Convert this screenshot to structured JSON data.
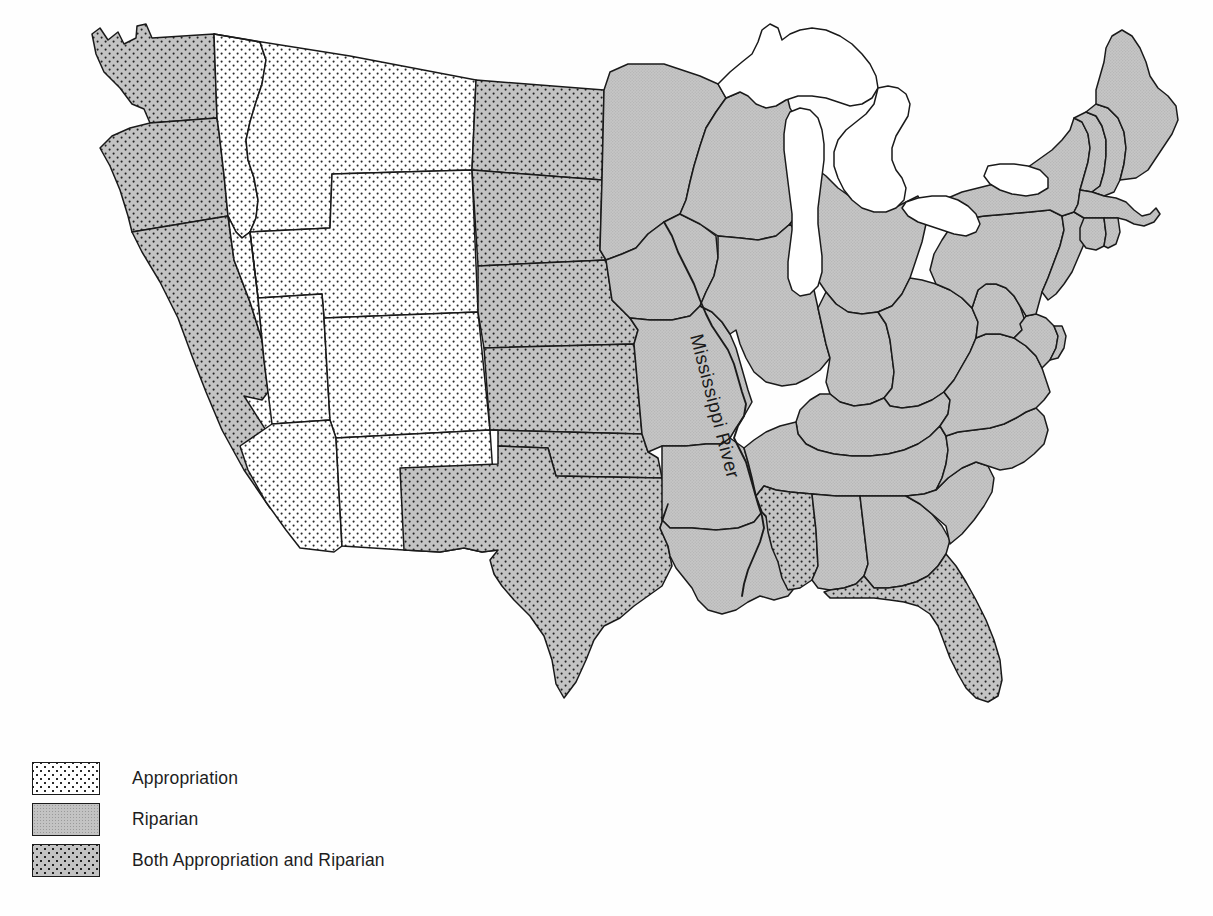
{
  "figure": {
    "background_color": "#fefefe"
  },
  "map": {
    "river_label": "Mississippi River",
    "colors": {
      "riparian_gray": "#c3c3c3",
      "appropriation_white": "#ffffff",
      "both_gray": "#c3c3c3",
      "dot_color": "#232323",
      "outline": "#1a1a1a",
      "lake_fill": "#ffffff"
    },
    "categories": {
      "appropriation": "Appropriation",
      "riparian": "Riparian",
      "both": "Both Appropriation and Riparian"
    },
    "states": [
      {
        "name": "Washington",
        "code": "WA",
        "doctrine": "both"
      },
      {
        "name": "Oregon",
        "code": "OR",
        "doctrine": "both"
      },
      {
        "name": "California",
        "code": "CA",
        "doctrine": "both"
      },
      {
        "name": "Idaho",
        "code": "ID",
        "doctrine": "appropriation"
      },
      {
        "name": "Nevada",
        "code": "NV",
        "doctrine": "appropriation"
      },
      {
        "name": "Montana",
        "code": "MT",
        "doctrine": "appropriation"
      },
      {
        "name": "Wyoming",
        "code": "WY",
        "doctrine": "appropriation"
      },
      {
        "name": "Utah",
        "code": "UT",
        "doctrine": "appropriation"
      },
      {
        "name": "Arizona",
        "code": "AZ",
        "doctrine": "appropriation"
      },
      {
        "name": "Colorado",
        "code": "CO",
        "doctrine": "appropriation"
      },
      {
        "name": "New Mexico",
        "code": "NM",
        "doctrine": "appropriation"
      },
      {
        "name": "North Dakota",
        "code": "ND",
        "doctrine": "both"
      },
      {
        "name": "South Dakota",
        "code": "SD",
        "doctrine": "both"
      },
      {
        "name": "Nebraska",
        "code": "NE",
        "doctrine": "both"
      },
      {
        "name": "Kansas",
        "code": "KS",
        "doctrine": "both"
      },
      {
        "name": "Oklahoma",
        "code": "OK",
        "doctrine": "both"
      },
      {
        "name": "Texas",
        "code": "TX",
        "doctrine": "both"
      },
      {
        "name": "Minnesota",
        "code": "MN",
        "doctrine": "riparian"
      },
      {
        "name": "Iowa",
        "code": "IA",
        "doctrine": "riparian"
      },
      {
        "name": "Missouri",
        "code": "MO",
        "doctrine": "riparian"
      },
      {
        "name": "Arkansas",
        "code": "AR",
        "doctrine": "riparian"
      },
      {
        "name": "Louisiana",
        "code": "LA",
        "doctrine": "riparian"
      },
      {
        "name": "Wisconsin",
        "code": "WI",
        "doctrine": "riparian"
      },
      {
        "name": "Illinois",
        "code": "IL",
        "doctrine": "riparian"
      },
      {
        "name": "Michigan",
        "code": "MI",
        "doctrine": "riparian"
      },
      {
        "name": "Indiana",
        "code": "IN",
        "doctrine": "riparian"
      },
      {
        "name": "Ohio",
        "code": "OH",
        "doctrine": "riparian"
      },
      {
        "name": "Kentucky",
        "code": "KY",
        "doctrine": "riparian"
      },
      {
        "name": "Tennessee",
        "code": "TN",
        "doctrine": "riparian"
      },
      {
        "name": "Mississippi",
        "code": "MS",
        "doctrine": "both"
      },
      {
        "name": "Alabama",
        "code": "AL",
        "doctrine": "riparian"
      },
      {
        "name": "Georgia",
        "code": "GA",
        "doctrine": "riparian"
      },
      {
        "name": "Florida",
        "code": "FL",
        "doctrine": "both"
      },
      {
        "name": "South Carolina",
        "code": "SC",
        "doctrine": "riparian"
      },
      {
        "name": "North Carolina",
        "code": "NC",
        "doctrine": "riparian"
      },
      {
        "name": "Virginia",
        "code": "VA",
        "doctrine": "riparian"
      },
      {
        "name": "West Virginia",
        "code": "WV",
        "doctrine": "riparian"
      },
      {
        "name": "Maryland",
        "code": "MD",
        "doctrine": "riparian"
      },
      {
        "name": "Delaware",
        "code": "DE",
        "doctrine": "riparian"
      },
      {
        "name": "Pennsylvania",
        "code": "PA",
        "doctrine": "riparian"
      },
      {
        "name": "New Jersey",
        "code": "NJ",
        "doctrine": "riparian"
      },
      {
        "name": "New York",
        "code": "NY",
        "doctrine": "riparian"
      },
      {
        "name": "Connecticut",
        "code": "CT",
        "doctrine": "riparian"
      },
      {
        "name": "Rhode Island",
        "code": "RI",
        "doctrine": "riparian"
      },
      {
        "name": "Massachusetts",
        "code": "MA",
        "doctrine": "riparian"
      },
      {
        "name": "Vermont",
        "code": "VT",
        "doctrine": "riparian"
      },
      {
        "name": "New Hampshire",
        "code": "NH",
        "doctrine": "riparian"
      },
      {
        "name": "Maine",
        "code": "ME",
        "doctrine": "riparian"
      }
    ],
    "lakes": [
      {
        "name": "Lake Superior"
      },
      {
        "name": "Lake Michigan"
      },
      {
        "name": "Lake Huron"
      },
      {
        "name": "Lake Erie"
      },
      {
        "name": "Lake Ontario"
      }
    ]
  },
  "legend": {
    "items": [
      {
        "pattern": "appropriation",
        "label": "Appropriation"
      },
      {
        "pattern": "riparian",
        "label": "Riparian"
      },
      {
        "pattern": "both",
        "label": "Both Appropriation and Riparian"
      }
    ]
  }
}
